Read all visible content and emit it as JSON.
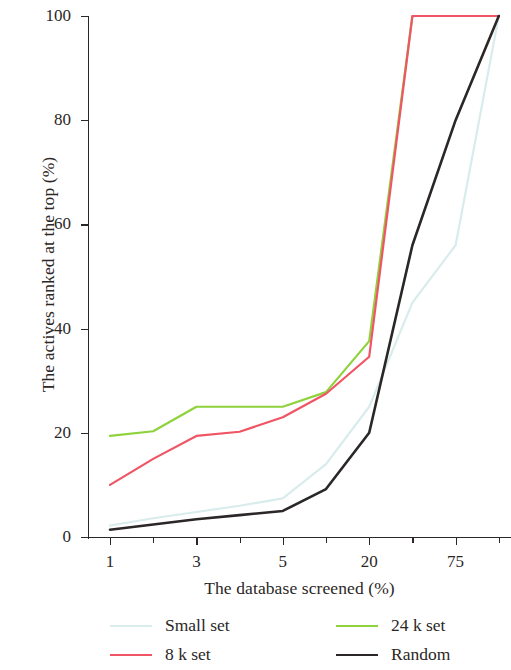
{
  "chart_data": {
    "type": "line",
    "title": "",
    "xlabel": "The database screened (%)",
    "ylabel": "The actives ranked at the top (%)",
    "x_tick_labels": [
      "1",
      "3",
      "5",
      "20",
      "75"
    ],
    "x_tick_positions": [
      1,
      3,
      5,
      20,
      75
    ],
    "x_minor_ticks_between": 1,
    "y_tick_labels": [
      "0",
      "20",
      "40",
      "60",
      "80",
      "100"
    ],
    "ylim": [
      0,
      100
    ],
    "grid": false,
    "legend_position": "below-plot",
    "x_categories": [
      "1",
      "2",
      "3",
      "4",
      "5",
      "10",
      "20",
      "40",
      "75",
      "100"
    ],
    "series": [
      {
        "name": "Small set",
        "color": "#d9ecec",
        "values": [
          2.2,
          3.6,
          4.8,
          6.0,
          7.4,
          14.0,
          25.0,
          45.0,
          56.0,
          100.0
        ]
      },
      {
        "name": "8 k set",
        "color": "#ef5565",
        "values": [
          10.0,
          15.0,
          19.4,
          20.2,
          23.0,
          27.5,
          34.6,
          100.0,
          100.0,
          100.0
        ]
      },
      {
        "name": "24 k set",
        "color": "#8ed23c",
        "values": [
          19.4,
          20.3,
          25.0,
          25.0,
          25.0,
          27.8,
          37.6,
          100.0,
          100.0,
          100.0
        ]
      },
      {
        "name": "Random",
        "color": "#2a2726",
        "values": [
          1.4,
          2.4,
          3.4,
          4.2,
          5.0,
          9.2,
          20.0,
          56.0,
          80.0,
          100.0
        ]
      }
    ]
  },
  "legend": {
    "items": [
      {
        "label": "Small set",
        "color": "#d9ecec"
      },
      {
        "label": "8 k set",
        "color": "#ef5565"
      },
      {
        "label": "24 k set",
        "color": "#8ed23c"
      },
      {
        "label": "Random",
        "color": "#2a2726"
      }
    ]
  },
  "axes": {
    "x_title": "The database screened (%)",
    "y_title": "The actives ranked at the top (%)",
    "y_ticks": [
      "0",
      "20",
      "40",
      "60",
      "80",
      "100"
    ],
    "x_ticks": [
      "1",
      "3",
      "5",
      "20",
      "75"
    ]
  }
}
